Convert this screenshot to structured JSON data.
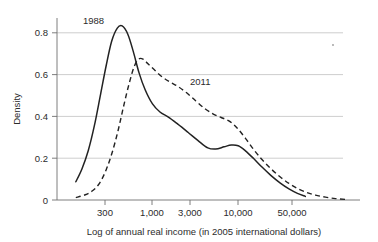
{
  "chart_data": {
    "type": "line",
    "title": "",
    "subtitle": "",
    "xlabel": "Log of annual real income (in 2005 international dollars)",
    "ylabel": "Density",
    "x_scale": "log",
    "x_tick_values": [
      300,
      1000,
      3000,
      10000,
      50000
    ],
    "x_tick_labels": [
      "300",
      "1,000",
      "3,000",
      "10,000",
      "50,000"
    ],
    "xlim": [
      120,
      230000
    ],
    "y_tick_values": [
      0,
      0.2,
      0.4,
      0.6,
      0.8
    ],
    "y_tick_labels": [
      "0",
      "0.2",
      "0.4",
      "0.6",
      "0.8"
    ],
    "ylim": [
      0,
      0.9
    ],
    "grid": "horizontal",
    "legend": "inline-annotations",
    "annotations": [
      {
        "text": "1988",
        "x": 300,
        "y": 0.86
      },
      {
        "text": "2011",
        "x": 2300,
        "y": 0.58
      }
    ],
    "series": [
      {
        "name": "1988",
        "style": "solid",
        "color": "#222222",
        "points": [
          {
            "x": 135,
            "y": 0.09
          },
          {
            "x": 160,
            "y": 0.155
          },
          {
            "x": 190,
            "y": 0.245
          },
          {
            "x": 225,
            "y": 0.37
          },
          {
            "x": 265,
            "y": 0.52
          },
          {
            "x": 310,
            "y": 0.665
          },
          {
            "x": 360,
            "y": 0.785
          },
          {
            "x": 420,
            "y": 0.85
          },
          {
            "x": 480,
            "y": 0.861
          },
          {
            "x": 560,
            "y": 0.82
          },
          {
            "x": 650,
            "y": 0.735
          },
          {
            "x": 760,
            "y": 0.63
          },
          {
            "x": 900,
            "y": 0.545
          },
          {
            "x": 1100,
            "y": 0.475
          },
          {
            "x": 1350,
            "y": 0.435
          },
          {
            "x": 1700,
            "y": 0.41
          },
          {
            "x": 2200,
            "y": 0.375
          },
          {
            "x": 2900,
            "y": 0.335
          },
          {
            "x": 3800,
            "y": 0.295
          },
          {
            "x": 5000,
            "y": 0.258
          },
          {
            "x": 6200,
            "y": 0.252
          },
          {
            "x": 7800,
            "y": 0.263
          },
          {
            "x": 9500,
            "y": 0.272
          },
          {
            "x": 11500,
            "y": 0.268
          },
          {
            "x": 14000,
            "y": 0.243
          },
          {
            "x": 17500,
            "y": 0.205
          },
          {
            "x": 22000,
            "y": 0.163
          },
          {
            "x": 28000,
            "y": 0.122
          },
          {
            "x": 36000,
            "y": 0.085
          },
          {
            "x": 46000,
            "y": 0.055
          },
          {
            "x": 58000,
            "y": 0.033
          },
          {
            "x": 72000,
            "y": 0.018
          }
        ]
      },
      {
        "name": "2011",
        "style": "dashed",
        "color": "#222222",
        "points": [
          {
            "x": 135,
            "y": 0.012
          },
          {
            "x": 175,
            "y": 0.026
          },
          {
            "x": 215,
            "y": 0.047
          },
          {
            "x": 260,
            "y": 0.085
          },
          {
            "x": 310,
            "y": 0.15
          },
          {
            "x": 365,
            "y": 0.235
          },
          {
            "x": 430,
            "y": 0.345
          },
          {
            "x": 500,
            "y": 0.465
          },
          {
            "x": 580,
            "y": 0.575
          },
          {
            "x": 670,
            "y": 0.662
          },
          {
            "x": 760,
            "y": 0.698
          },
          {
            "x": 860,
            "y": 0.695
          },
          {
            "x": 980,
            "y": 0.672
          },
          {
            "x": 1150,
            "y": 0.645
          },
          {
            "x": 1400,
            "y": 0.612
          },
          {
            "x": 1750,
            "y": 0.585
          },
          {
            "x": 2200,
            "y": 0.562
          },
          {
            "x": 2800,
            "y": 0.53
          },
          {
            "x": 3600,
            "y": 0.49
          },
          {
            "x": 4600,
            "y": 0.452
          },
          {
            "x": 5800,
            "y": 0.425
          },
          {
            "x": 7200,
            "y": 0.408
          },
          {
            "x": 9000,
            "y": 0.39
          },
          {
            "x": 11200,
            "y": 0.355
          },
          {
            "x": 14000,
            "y": 0.305
          },
          {
            "x": 17500,
            "y": 0.25
          },
          {
            "x": 22000,
            "y": 0.2
          },
          {
            "x": 28000,
            "y": 0.155
          },
          {
            "x": 36000,
            "y": 0.115
          },
          {
            "x": 46000,
            "y": 0.082
          },
          {
            "x": 58000,
            "y": 0.057
          },
          {
            "x": 74000,
            "y": 0.038
          },
          {
            "x": 95000,
            "y": 0.024
          },
          {
            "x": 125000,
            "y": 0.014
          },
          {
            "x": 165000,
            "y": 0.007
          },
          {
            "x": 215000,
            "y": 0.003
          }
        ]
      }
    ]
  },
  "figure": {
    "ylabel": "Density",
    "xlabel": "Log of annual real income (in 2005 international dollars)",
    "y_ticks": [
      "0.8",
      "0.6",
      "0.4",
      "0.2",
      "0"
    ],
    "x_ticks": [
      "300",
      "1,000",
      "3,000",
      "10,000",
      "50,000"
    ],
    "label_1988": "1988",
    "label_2011": "2011"
  }
}
